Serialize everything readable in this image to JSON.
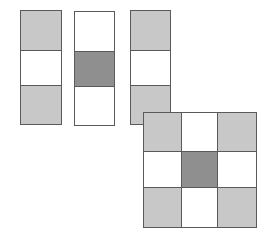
{
  "colors": {
    "light": "#c8c8c8",
    "dark": "#8f8f8f",
    "white": "#ffffff",
    "border": "#5a5a5a"
  },
  "strips": [
    {
      "id": "strip-1",
      "x": 20,
      "y": 10,
      "w": 42,
      "h": 114,
      "rows": [
        50,
        85
      ],
      "cells": [
        "light",
        "white",
        "light"
      ]
    },
    {
      "id": "strip-2",
      "x": 74,
      "y": 11,
      "w": 41,
      "h": 114,
      "rows": [
        51,
        86
      ],
      "cells": [
        "white",
        "dark",
        "white"
      ]
    },
    {
      "id": "strip-3",
      "x": 130,
      "y": 10,
      "w": 41,
      "h": 114,
      "rows": [
        50,
        85
      ],
      "cells": [
        "light",
        "white",
        "light"
      ]
    }
  ],
  "grid": {
    "x": 143,
    "y": 112,
    "w": 113,
    "h": 115,
    "cols": [
      143,
      181,
      217,
      256
    ],
    "rows": [
      112,
      151,
      187,
      227
    ],
    "cells": [
      [
        "light",
        "white",
        "light"
      ],
      [
        "white",
        "dark",
        "white"
      ],
      [
        "light",
        "white",
        "light"
      ]
    ]
  }
}
